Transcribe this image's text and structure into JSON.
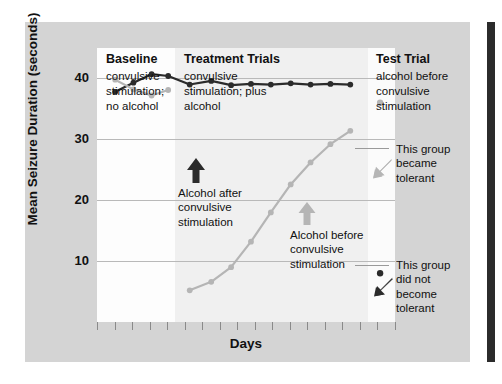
{
  "figure": {
    "y_axis_title": "Mean Seizure Duration (seconds)",
    "x_axis_title": "Days"
  },
  "panels": [
    {
      "key": "baseline",
      "title": "Baseline",
      "subtitle": "convulsive\nstimulation;\nno alcohol"
    },
    {
      "key": "treatment",
      "title": "Treatment Trials",
      "subtitle": "convulsive\nstimulation; plus\nalcohol"
    },
    {
      "key": "test",
      "title": "Test Trial",
      "subtitle": "alcohol before\nconvulsive\nstimulation"
    }
  ],
  "annotations": [
    {
      "key": "alcohol-after",
      "text": "Alcohol after\nconvulsive\nstimulation",
      "arrow_color": "#2b2b2b"
    },
    {
      "key": "alcohol-before",
      "text": "Alcohol before\nconvulsive\nstimulation",
      "arrow_color": "#b5b5b5"
    },
    {
      "key": "became-tolerant",
      "text": "This group\nbecame\ntolerant",
      "arrow_color": "#b5b5b5"
    },
    {
      "key": "not-tolerant",
      "text": "This group\ndid not\nbecome\ntolerant",
      "arrow_color": "#2b2b2b"
    }
  ],
  "colors": {
    "series_dark": "#2b2b2b",
    "series_light": "#b5b5b5",
    "gridline": "#b9b9b9",
    "figure_background": "#d4d4d4",
    "plot_background": "#ffffff",
    "band_treatment": "#f0f0f0",
    "right_bar": "#2b2b2b"
  },
  "chart_data": {
    "type": "line",
    "title": "",
    "xlabel": "Days",
    "ylabel": "Mean Seizure Duration (seconds)",
    "ylim": [
      0,
      45
    ],
    "yticks": [
      10,
      20,
      30,
      40
    ],
    "ytick_labels": [
      "10",
      "20",
      "30",
      "40"
    ],
    "xlim": [
      0,
      18
    ],
    "grid": "horizontal",
    "legend": "none",
    "phase_bands": [
      {
        "label": "Baseline",
        "x_start": 0,
        "x_end": 4.7
      },
      {
        "label": "Treatment Trials",
        "x_start": 4.7,
        "x_end": 16.4
      },
      {
        "label": "Test Trial",
        "x_start": 16.4,
        "x_end": 18
      }
    ],
    "series": [
      {
        "name": "Alcohol after convulsive stimulation (became tolerant)",
        "color": "#2b2b2b",
        "x": [
          1.1,
          2.2,
          3.3,
          4.3,
          5.6,
          6.9,
          8.1,
          9.3,
          10.5,
          11.7,
          12.9,
          14.1,
          15.3
        ],
        "values": [
          37.8,
          39.3,
          40.7,
          40.4,
          39.0,
          39.6,
          38.9,
          39.1,
          39.0,
          39.2,
          39.0,
          39.1,
          39.0
        ]
      },
      {
        "name": "Alcohol before convulsive stimulation (did not become tolerant)",
        "color": "#b5b5b5",
        "x": [
          1.1,
          2.2,
          3.3,
          4.3
        ],
        "values": [
          39.8,
          38.2,
          37.2,
          38.1
        ]
      },
      {
        "name": "Treatment ramp (alcohol before convulsive stimulation)",
        "color": "#b5b5b5",
        "x": [
          5.6,
          6.9,
          8.1,
          9.3,
          10.5,
          11.7,
          12.9,
          14.1,
          15.3
        ],
        "values": [
          5.2,
          6.6,
          9.0,
          13.2,
          18.0,
          22.6,
          26.2,
          29.2,
          31.4
        ]
      }
    ],
    "test_trial_points": [
      {
        "name": "This group became tolerant",
        "x": 17.1,
        "value": 36.0,
        "color": "#b5b5b5"
      },
      {
        "name": "This group did not become tolerant",
        "x": 17.1,
        "value": 8.0,
        "color": "#2b2b2b"
      }
    ]
  }
}
